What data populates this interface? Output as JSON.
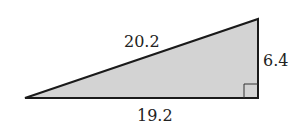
{
  "diagram": {
    "type": "right-triangle",
    "fill_color": "#d3d3d3",
    "stroke_color": "#1a1a1a",
    "labels": {
      "hypotenuse": "20.2",
      "vertical_leg": "6.4",
      "horizontal_leg": "19.2"
    },
    "right_angle_marker": true
  }
}
